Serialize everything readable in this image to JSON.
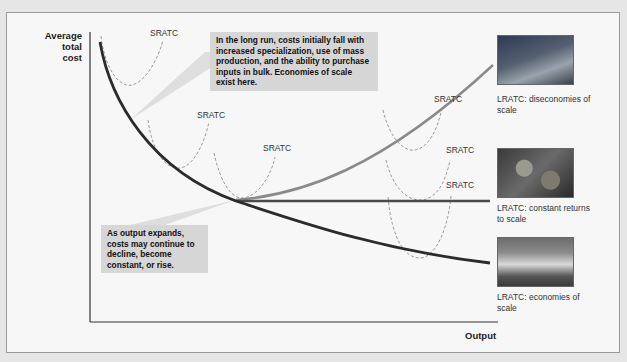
{
  "axes": {
    "y_label": "Average total cost",
    "x_label": "Output"
  },
  "sratc_labels": [
    "SRATC",
    "SRATC",
    "SRATC",
    "SRATC",
    "SRATC",
    "SRATC"
  ],
  "callouts": {
    "top": "In the long run, costs initially fall with increased specialization, use of mass production, and the ability to purchase inputs in bulk. Economies of scale exist here.",
    "bottom": "As output expands, costs may continue to decline, become constant, or rise."
  },
  "outcomes": [
    {
      "caption": "LRATC: diseconomies of scale",
      "photo": "hospital-building-photo"
    },
    {
      "caption": "LRATC: constant returns to scale",
      "photo": "food-plates-photo"
    },
    {
      "caption": "LRATC: economies of scale",
      "photo": "house-photo"
    }
  ],
  "colors": {
    "lratc_main": "#2b2b2b",
    "lratc_rising": "#8a8a8a",
    "sratc_dashed": "#9a9a9a",
    "callout_bg": "#d6d6d6",
    "frame_bg": "#f7f7f7"
  }
}
